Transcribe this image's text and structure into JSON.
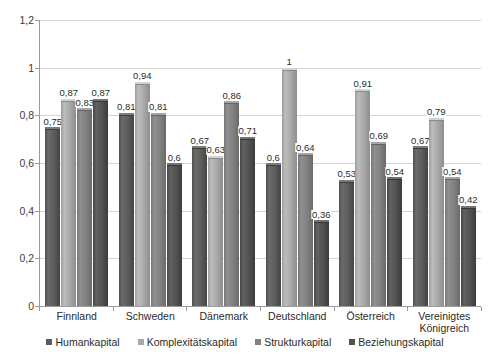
{
  "chart_data": {
    "type": "bar",
    "title": "",
    "subtitle": "",
    "xlabel": "",
    "ylabel": "",
    "ylim": [
      0,
      1.2
    ],
    "yticks": [
      0,
      0.2,
      0.4,
      0.6,
      0.8,
      1,
      1.2
    ],
    "ytick_labels": [
      "0",
      "0,2",
      "0,4",
      "0,6",
      "0,8",
      "1",
      "1,2"
    ],
    "grid": true,
    "legend_position": "bottom",
    "decimal_separator": ",",
    "categories": [
      "Finnland",
      "Schweden",
      "Dänemark",
      "Deutschland",
      "Österreich",
      "Vereinigtes\nKönigreich"
    ],
    "series": [
      {
        "name": "Humankapital",
        "color": "#5c5c5c",
        "values": [
          0.75,
          0.81,
          0.67,
          0.6,
          0.53,
          0.67
        ],
        "labels": [
          "0,75",
          "0,81",
          "0,67",
          "0,6",
          "0,53",
          "0,67"
        ]
      },
      {
        "name": "Komplexitätskapital",
        "color": "#a8a8a8",
        "values": [
          0.87,
          0.94,
          0.63,
          1,
          0.91,
          0.79
        ],
        "labels": [
          "0,87",
          "0,94",
          "0,63",
          "1",
          "0,91",
          "0,79"
        ]
      },
      {
        "name": "Strukturkapital",
        "color": "#818181",
        "values": [
          0.83,
          0.81,
          0.86,
          0.64,
          0.69,
          0.54
        ],
        "labels": [
          "0,83",
          "0,81",
          "0,86",
          "0,64",
          "0,69",
          "0,54"
        ]
      },
      {
        "name": "Beziehungskapital",
        "color": "#525252",
        "values": [
          0.87,
          0.6,
          0.71,
          0.36,
          0.54,
          0.42
        ],
        "labels": [
          "0,87",
          "0,6",
          "0,71",
          "0,36",
          "0,54",
          "0,42"
        ]
      }
    ]
  }
}
